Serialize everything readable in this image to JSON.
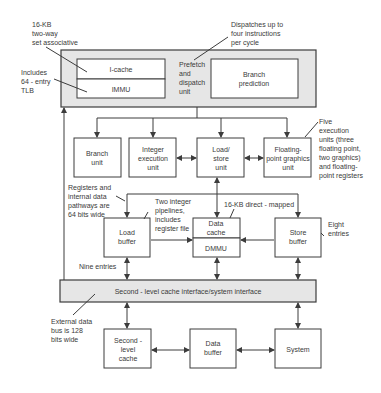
{
  "diagram": {
    "top_unit": {
      "icache": "I-cache",
      "immu": "IMMU",
      "prefetch": [
        "Prefetch",
        "and",
        "dispatch",
        "unit"
      ],
      "branch_prediction": [
        "Branch",
        "prediction"
      ]
    },
    "execution_units": {
      "branch_unit": [
        "Branch",
        "unit"
      ],
      "integer_unit": [
        "Integer",
        "execution",
        "unit"
      ],
      "load_store_unit": [
        "Load/",
        "store",
        "unit"
      ],
      "fp_graphics_unit": [
        "Floating-",
        "point graphics",
        "unit"
      ]
    },
    "memory_units": {
      "load_buffer": [
        "Load",
        "buffer"
      ],
      "data_cache": [
        "Data",
        "cache"
      ],
      "dmmu": "DMMU",
      "store_buffer": [
        "Store",
        "buffer"
      ]
    },
    "interface_bar": "Second - level cache interface/system interface",
    "bottom_units": {
      "second_level_cache": [
        "Second -",
        "level",
        "cache"
      ],
      "data_buffer": [
        "Data",
        "buffer"
      ],
      "system": "System"
    },
    "annotations": {
      "icache_note": [
        "16-KB",
        "two-way",
        "set associative"
      ],
      "tlb_note": [
        "Includes",
        "64 - entry",
        "TLB"
      ],
      "dispatch_note": [
        "Dispatches up to",
        "four instructions",
        "per cycle"
      ],
      "exec_note": [
        "Five",
        "execution",
        "units (three",
        "floating point,",
        "two graphics)",
        "and floating-",
        "point registers"
      ],
      "registers_note": [
        "Registers and",
        "internal data",
        "pathways are",
        "64 bits wide"
      ],
      "pipelines_note": [
        "Two integer",
        "pipelines,",
        "includes",
        "register file"
      ],
      "dcache_note": "16-KB direct - mapped",
      "store_note": [
        "Eight",
        "entries"
      ],
      "load_note": "Nine entries",
      "bus_note": [
        "External data",
        "bus is 128",
        "bits wide"
      ]
    },
    "colors": {
      "gray_fill": "#e6e6e6",
      "line": "#3c3c3c",
      "box_fill": "#ffffff"
    }
  }
}
